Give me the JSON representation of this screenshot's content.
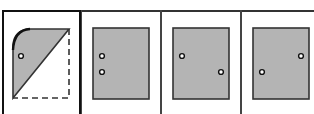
{
  "question": {
    "prompt_partial": ""
  },
  "options": [
    {
      "index": 1,
      "selected": true,
      "figure": "folded-sheet",
      "description": "Rectangle folded along diagonal: shaded triangle upper-left with curved corner, dashed outline lower-right, one hole",
      "rect": {
        "x": 13,
        "y": 29,
        "w": 56,
        "h": 69
      },
      "holes": [
        {
          "x": 21,
          "y": 56
        }
      ]
    },
    {
      "index": 2,
      "selected": false,
      "figure": "unfolded-sheet",
      "rect": {
        "x": 93,
        "y": 28,
        "w": 56,
        "h": 71
      },
      "holes": [
        {
          "x": 102,
          "y": 56
        },
        {
          "x": 102,
          "y": 72
        }
      ]
    },
    {
      "index": 3,
      "selected": false,
      "figure": "unfolded-sheet",
      "rect": {
        "x": 173,
        "y": 28,
        "w": 56,
        "h": 71
      },
      "holes": [
        {
          "x": 182,
          "y": 56
        },
        {
          "x": 221,
          "y": 72
        }
      ]
    },
    {
      "index": 4,
      "selected": false,
      "figure": "unfolded-sheet",
      "rect": {
        "x": 253,
        "y": 28,
        "w": 56,
        "h": 71
      },
      "holes": [
        {
          "x": 301,
          "y": 56
        },
        {
          "x": 262,
          "y": 72
        }
      ]
    }
  ],
  "colors": {
    "paper_fill": "#b4b4b4",
    "outline": "#333333",
    "hole_stroke": "#111111",
    "background": "#ffffff"
  }
}
